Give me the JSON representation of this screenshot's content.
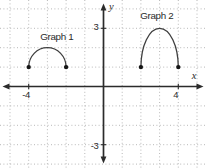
{
  "figure": {
    "graph1_label": "Graph 1",
    "graph2_label": "Graph 2"
  },
  "chart_data": {
    "type": "line",
    "title": "",
    "xlabel": "x",
    "ylabel": "y",
    "xlim": [
      -5.5,
      5.5
    ],
    "ylim": [
      -4.3,
      4.3
    ],
    "grid": true,
    "grid_style": "dotted",
    "x_ticks_labeled": [
      {
        "value": -4,
        "label": "-4"
      },
      {
        "value": 4,
        "label": "4"
      }
    ],
    "y_ticks_labeled": [
      {
        "value": 3,
        "label": "3"
      },
      {
        "value": -3,
        "label": "-3"
      }
    ],
    "series": [
      {
        "name": "Graph 1",
        "shape": "upper_semicircular_arc",
        "endpoints": [
          [
            -4,
            1
          ],
          [
            -2,
            1
          ]
        ],
        "peak": [
          -3,
          2
        ],
        "endpoint_style": "closed_dot",
        "label_position": [
          -2.5,
          2.58
        ]
      },
      {
        "name": "Graph 2",
        "shape": "upper_semicircular_arc",
        "endpoints": [
          [
            2,
            1
          ],
          [
            4,
            1
          ]
        ],
        "peak": [
          3,
          3
        ],
        "endpoint_style": "closed_dot",
        "label_position": [
          2.85,
          3.64
        ]
      }
    ],
    "colors": {
      "axis": "#2b2b2b",
      "grid": "#b8b8b8",
      "curve": "#3f3f3f",
      "point": "#161616",
      "text": "#2b2b2b",
      "background": "#ffffff"
    }
  }
}
